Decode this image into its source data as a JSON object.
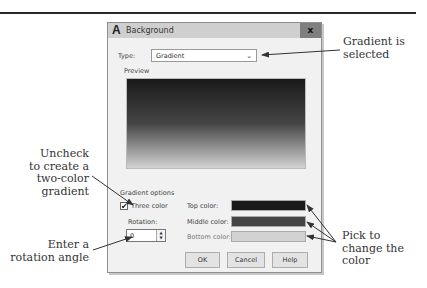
{
  "dialog": {
    "title": "Background",
    "app_icon": "A",
    "close_label": "x",
    "type_label": "Type:",
    "type_value": "Gradient",
    "type_chevron": "⌄",
    "preview_label": "Preview",
    "gradient_options_label": "Gradient options",
    "three_color_label": "Three color",
    "three_color_checked": "✔",
    "rotation_label": "Rotation:",
    "rotation_value": "0",
    "spinner_up": "▲",
    "spinner_down": "▼",
    "top_color_label": "Top color:",
    "middle_color_label": "Middle color:",
    "bottom_color_label": "Bottom color:",
    "colors": {
      "top": "#1a1a1a",
      "middle": "#454545",
      "bottom": "#d2d2d2"
    },
    "buttons": {
      "ok": "OK",
      "cancel": "Cancel",
      "help": "Help"
    }
  },
  "annotations": {
    "gradient_selected": [
      "Gradient is",
      "selected"
    ],
    "uncheck": [
      "Uncheck",
      "to create a",
      "two-color",
      "gradient"
    ],
    "rotation": [
      "Enter a",
      "rotation angle"
    ],
    "pick_color": [
      "Pick to",
      "change the",
      "color"
    ]
  }
}
